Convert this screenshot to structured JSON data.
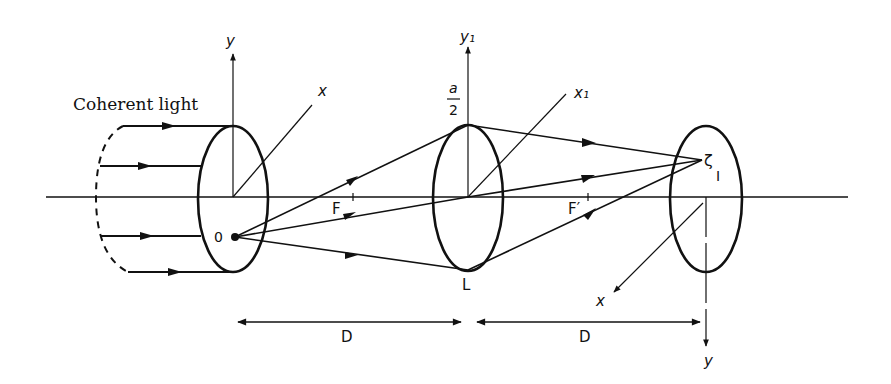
{
  "diagram": {
    "title_label": "Coherent light",
    "object_plane": {
      "label_origin": "0",
      "axis_y": "y",
      "axis_x": "x"
    },
    "lens": {
      "label": "L",
      "axis_y": "y₁",
      "axis_x": "x₁",
      "aperture_num": "a",
      "aperture_den": "2"
    },
    "focal_points": {
      "front": "F",
      "back": "F′"
    },
    "image_plane": {
      "image_point": "I",
      "axis_x": "x",
      "axis_y": "y",
      "image_glyph": "ζ"
    },
    "distances": [
      {
        "label": "D"
      },
      {
        "label": "D"
      }
    ],
    "colors": {
      "ink": "#111111",
      "background": "#ffffff"
    }
  }
}
